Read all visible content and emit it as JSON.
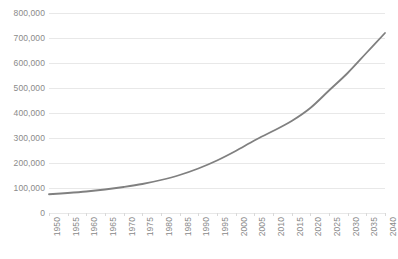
{
  "chart_data": {
    "type": "line",
    "title": "",
    "subtitle": "",
    "xlabel": "",
    "ylabel": "",
    "grid": "horizontal",
    "legend": "none",
    "line_color": "#808080",
    "gridline_color": "#E8E8E8",
    "tick_label_color": "#8A8A8A",
    "background": "#FFFFFF",
    "xlim": [
      1950,
      2040
    ],
    "ylim": [
      0,
      800000
    ],
    "ytick_labels": [
      "800,000",
      "700,000",
      "600,000",
      "500,000",
      "400,000",
      "300,000",
      "200,000",
      "100,000",
      "0"
    ],
    "ytick_values": [
      800000,
      700000,
      600000,
      500000,
      400000,
      300000,
      200000,
      100000,
      0
    ],
    "xtick_labels": [
      "1950",
      "1955",
      "1960",
      "1965",
      "1970",
      "1975",
      "1980",
      "1985",
      "1990",
      "1995",
      "2000",
      "2005",
      "2010",
      "2015",
      "2020",
      "2025",
      "2030",
      "2035",
      "2040"
    ],
    "categories": [
      1950,
      1955,
      1960,
      1965,
      1970,
      1975,
      1980,
      1985,
      1990,
      1995,
      2000,
      2005,
      2010,
      2015,
      2020,
      2025,
      2030,
      2035,
      2040
    ],
    "values": [
      75000,
      80000,
      86000,
      94000,
      104000,
      116000,
      132000,
      152000,
      178000,
      210000,
      248000,
      290000,
      328000,
      368000,
      420000,
      490000,
      560000,
      640000,
      720000
    ],
    "series": [
      {
        "name": "Series 1",
        "color": "#808080",
        "values": [
          75000,
          80000,
          86000,
          94000,
          104000,
          116000,
          132000,
          152000,
          178000,
          210000,
          248000,
          290000,
          328000,
          368000,
          420000,
          490000,
          560000,
          640000,
          720000
        ]
      }
    ]
  }
}
